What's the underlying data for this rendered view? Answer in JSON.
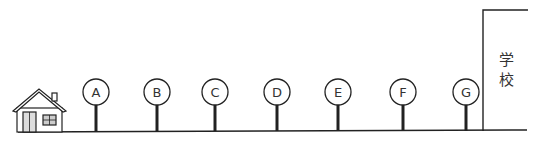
{
  "diagram": {
    "start_label": "house",
    "end_label": "学校",
    "end_label_chars": [
      "学",
      "校"
    ],
    "signs": [
      {
        "label": "A",
        "x": 96
      },
      {
        "label": "B",
        "x": 157
      },
      {
        "label": "C",
        "x": 215
      },
      {
        "label": "D",
        "x": 277
      },
      {
        "label": "E",
        "x": 338
      },
      {
        "label": "F",
        "x": 403
      },
      {
        "label": "G",
        "x": 466
      }
    ],
    "colors": {
      "line": "#222222",
      "background": "#ffffff"
    }
  }
}
